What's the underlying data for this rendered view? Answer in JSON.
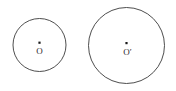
{
  "figure": {
    "background_color": "#ffffff",
    "stroke_color": "#3a3a3a",
    "dot_color": "#1a1a1a",
    "label_color": "#2b2b2b",
    "width": 176,
    "height": 91
  },
  "shapes": {
    "left_circle": {
      "name": "small circle",
      "center_label": "O",
      "cx": 39.5,
      "cy": 45,
      "r": 26.5
    },
    "right_circle": {
      "name": "large circle",
      "center_label": "O′",
      "cx": 126.5,
      "cy": 45.5,
      "r": 38
    }
  }
}
